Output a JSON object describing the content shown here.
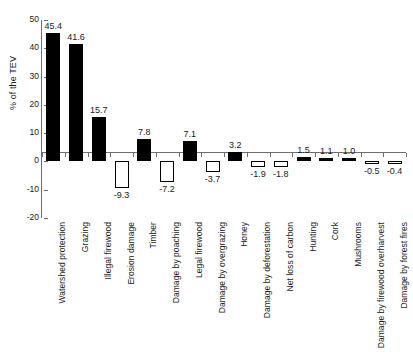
{
  "chart_data": {
    "type": "bar",
    "title": "",
    "subtitle": "",
    "xlabel": "",
    "ylabel": "% of the TEV",
    "ylim": [
      -20,
      50
    ],
    "ytick_values": [
      50,
      40,
      30,
      20,
      10,
      0,
      -10,
      -20
    ],
    "ytick_labels": [
      "50",
      "40",
      "30",
      "20",
      "10",
      "0",
      "-10",
      "-20"
    ],
    "grid": false,
    "legend": null,
    "bar_styles": {
      "positive": "filled-black",
      "negative": "white-with-black-outline"
    },
    "colors": {
      "positive_fill": "#000000",
      "negative_fill": "#ffffff",
      "bar_outline": "#000000",
      "axis": "#6e6e6e",
      "text": "#1a1a1a",
      "background": "#ffffff"
    },
    "categories": [
      "Watershed protection",
      "Grazing",
      "Illegal firewood",
      "Erosion damage",
      "Timber",
      "Damage by poaching",
      "Legal firewood",
      "Damage by overgrazing",
      "Honey",
      "Damage by deforestation",
      "Net loss of carbon",
      "Hunting",
      "Cork",
      "Mushrooms",
      "Damage by firewood overharvest",
      "Damage by forest fires"
    ],
    "values": [
      45.4,
      41.6,
      15.7,
      -9.3,
      7.8,
      -7.2,
      7.1,
      -3.7,
      3.2,
      -1.9,
      -1.8,
      1.5,
      1.1,
      1.0,
      -0.5,
      -0.4
    ],
    "data_labels": [
      "45.4",
      "41.6",
      "15.7",
      "-9.3",
      "7.8",
      "-7.2",
      "7.1",
      "-3.7",
      "3.2",
      "-1.9",
      "-1.8",
      "1.5",
      "1.1",
      "1.0",
      "-0.5",
      "-0.4"
    ]
  }
}
